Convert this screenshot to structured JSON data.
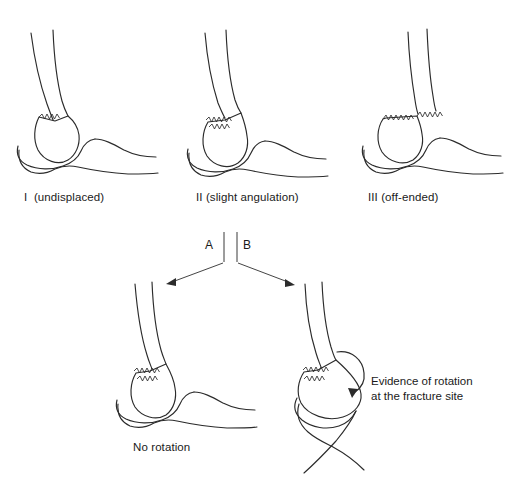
{
  "figure": {
    "line_color": "#2b2b2b",
    "background_color": "#ffffff"
  },
  "top_row": {
    "captions": [
      {
        "id": "type-1",
        "label": "I  (undisplaced)"
      },
      {
        "id": "type-2",
        "label": "II (slight angulation)"
      },
      {
        "id": "type-3",
        "label": "III (off-ended)"
      }
    ]
  },
  "branch": {
    "label_a": "A",
    "label_b": "B"
  },
  "bottom_row": {
    "left_caption": "No rotation",
    "right_annotation_line1": "Evidence of rotation",
    "right_annotation_line2": "at the fracture site"
  }
}
